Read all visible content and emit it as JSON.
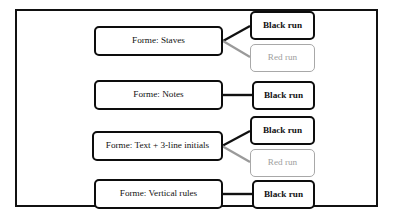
{
  "figure": {
    "frame_color": "#111111",
    "background": "#ffffff",
    "black_node_color": "#111111",
    "red_node_color": "#a0a0a0",
    "connector_black_color": "#111111",
    "connector_gray_color": "#9a9a9a"
  },
  "rows": [
    {
      "id": "staves",
      "forme_label": "Forme: Staves",
      "runs": [
        {
          "label": "Black run",
          "style": "black"
        },
        {
          "label": "Red run",
          "style": "red"
        }
      ]
    },
    {
      "id": "notes",
      "forme_label": "Forme: Notes",
      "runs": [
        {
          "label": "Black run",
          "style": "black"
        }
      ]
    },
    {
      "id": "text-initials",
      "forme_label": "Forme: Text + 3-line initials",
      "runs": [
        {
          "label": "Black run",
          "style": "black"
        },
        {
          "label": "Red run",
          "style": "red"
        }
      ]
    },
    {
      "id": "vertical-rules",
      "forme_label": "Forme: Vertical rules",
      "runs": [
        {
          "label": "Black run",
          "style": "black"
        }
      ]
    }
  ]
}
